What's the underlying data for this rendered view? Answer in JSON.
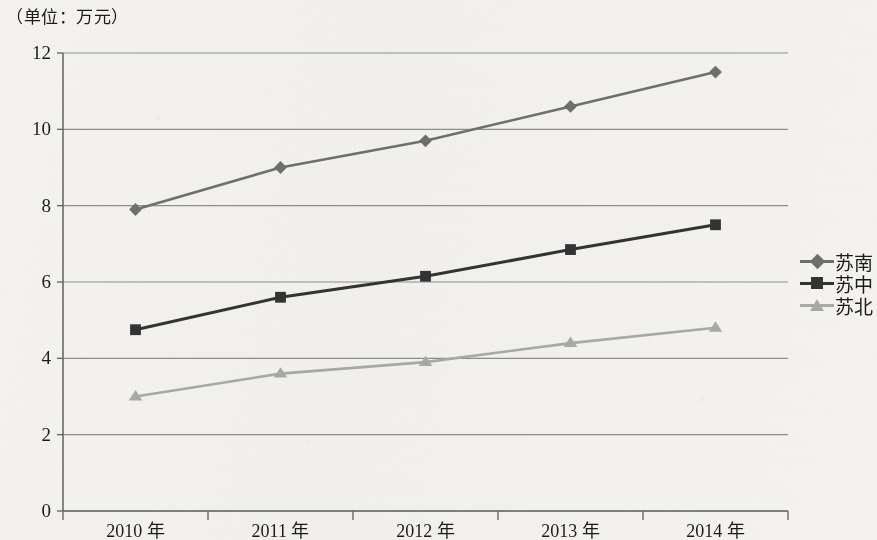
{
  "title": "（单位：万元）",
  "legend": {
    "position": "right-middle",
    "entries": [
      {
        "label": "苏南",
        "marker": "diamond",
        "color": "#6f6f6f"
      },
      {
        "label": "苏中",
        "marker": "square",
        "color": "#333333"
      },
      {
        "label": "苏北",
        "marker": "triangle",
        "color": "#a9a9a9"
      }
    ]
  },
  "axes": {
    "y_ticks": [
      "0",
      "2",
      "4",
      "6",
      "8",
      "10",
      "12"
    ],
    "x_ticks": [
      "2010 年",
      "2011 年",
      "2012 年",
      "2013 年",
      "2014 年"
    ]
  },
  "chart_data": {
    "type": "line",
    "title": "（单位：万元）",
    "xlabel": "",
    "ylabel": "（单位：万元）",
    "categories": [
      "2010 年",
      "2011 年",
      "2012 年",
      "2013 年",
      "2014 年"
    ],
    "ylim": [
      0,
      12
    ],
    "ytick_step": 2,
    "grid": "horizontal",
    "legend_position": "right",
    "series": [
      {
        "name": "苏南",
        "marker": "diamond",
        "color": "#6f6f6f",
        "values": [
          7.9,
          9.0,
          9.7,
          10.6,
          11.5
        ]
      },
      {
        "name": "苏中",
        "marker": "square",
        "color": "#333333",
        "values": [
          4.75,
          5.6,
          6.15,
          6.85,
          7.5
        ]
      },
      {
        "name": "苏北",
        "marker": "triangle",
        "color": "#a9a9a9",
        "values": [
          3.0,
          3.6,
          3.9,
          4.4,
          4.8
        ]
      }
    ]
  }
}
